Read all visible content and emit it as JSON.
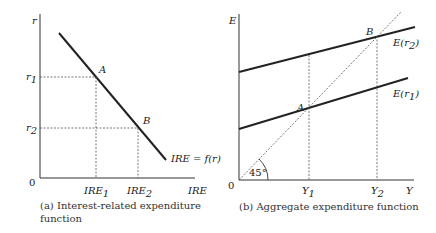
{
  "panel_a": {
    "y_axis_label": "r",
    "x_axis_label": "IRE",
    "origin": "0",
    "tick_y": [
      "r",
      "1",
      "r",
      "2"
    ],
    "r1": {
      "base": "r",
      "sub": "1"
    },
    "r2": {
      "base": "r",
      "sub": "2"
    },
    "ire1": {
      "base": "IRE",
      "sub": "1"
    },
    "ire2": {
      "base": "IRE",
      "sub": "2"
    },
    "point_a": "A",
    "point_b": "B",
    "curve_label": "IRE = f(r)",
    "caption_line1": "(a) Interest-related expenditure",
    "caption_line2": "function"
  },
  "panel_b": {
    "y_axis_label": "E",
    "x_axis_label": "Y",
    "origin": "0",
    "y1": {
      "base": "Y",
      "sub": "1"
    },
    "y2": {
      "base": "Y",
      "sub": "2"
    },
    "point_a": "A",
    "point_b": "B",
    "line_upper_label": {
      "base": "E(r",
      "sub": "2",
      "close": ")"
    },
    "line_lower_label": {
      "base": "E(r",
      "sub": "1",
      "close": ")"
    },
    "angle_label": "45°",
    "caption": "(b) Aggregate expenditure function"
  }
}
